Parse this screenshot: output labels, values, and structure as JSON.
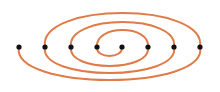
{
  "diagram": {
    "type": "meander-spiral",
    "curve_color": "#e07a47",
    "point_color": "#111111",
    "points": [
      {
        "x": 19,
        "y": 47
      },
      {
        "x": 45,
        "y": 47
      },
      {
        "x": 71,
        "y": 47
      },
      {
        "x": 97,
        "y": 47
      },
      {
        "x": 122,
        "y": 47
      },
      {
        "x": 148,
        "y": 47
      },
      {
        "x": 174,
        "y": 47
      },
      {
        "x": 200,
        "y": 47
      }
    ],
    "arcs": [
      {
        "from": 0,
        "to": 7,
        "side": "below",
        "depth": 80
      },
      {
        "from": 7,
        "to": 1,
        "side": "above",
        "depth": 13
      },
      {
        "from": 1,
        "to": 6,
        "side": "below",
        "depth": 73
      },
      {
        "from": 6,
        "to": 2,
        "side": "above",
        "depth": 22
      },
      {
        "from": 2,
        "to": 5,
        "side": "below",
        "depth": 66
      },
      {
        "from": 5,
        "to": 3,
        "side": "above",
        "depth": 30
      },
      {
        "from": 3,
        "to": 4,
        "side": "below",
        "depth": 56
      }
    ]
  }
}
